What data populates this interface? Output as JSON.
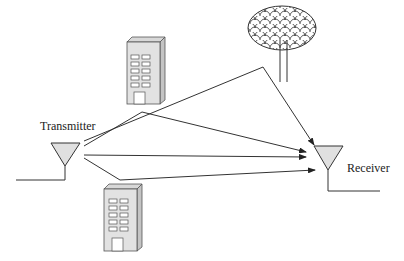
{
  "diagram": {
    "labels": {
      "transmitter": "Transmitter",
      "receiver": "Receiver"
    },
    "elements": [
      "transmitter-antenna",
      "receiver-antenna",
      "building-top",
      "building-bottom",
      "tree"
    ],
    "paths": [
      {
        "name": "tree-reflection",
        "points": [
          [
            83,
            141
          ],
          [
            263,
            67
          ],
          [
            313,
            147
          ]
        ]
      },
      {
        "name": "building-top-reflection",
        "points": [
          [
            83,
            146
          ],
          [
            142,
            112
          ],
          [
            305,
            151
          ]
        ]
      },
      {
        "name": "direct-path",
        "points": [
          [
            83,
            155
          ],
          [
            305,
            158
          ]
        ]
      },
      {
        "name": "building-bottom-reflection",
        "points": [
          [
            83,
            158
          ],
          [
            120,
            180
          ],
          [
            305,
            170
          ]
        ]
      }
    ],
    "colors": {
      "line": "#333333",
      "fill": "#e0e0e0",
      "window": "#ffffff"
    }
  }
}
